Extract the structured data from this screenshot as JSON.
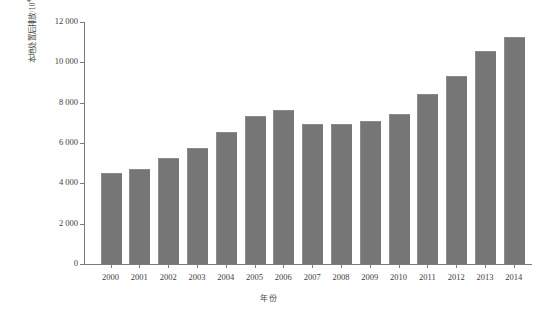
{
  "chart_data": {
    "type": "bar",
    "title": "",
    "subtitle": "",
    "xlabel": "年份",
    "ylabel": "本地处置后排放/10⁴ t",
    "ylabel_text": "本地处置后排放/10",
    "ylabel_unit_sup": "4",
    "ylabel_unit_tail": " t",
    "categories": [
      "2000",
      "2001",
      "2002",
      "2003",
      "2004",
      "2005",
      "2006",
      "2007",
      "2008",
      "2009",
      "2010",
      "2011",
      "2012",
      "2013",
      "2014"
    ],
    "values": [
      4480,
      4640,
      5200,
      5720,
      6500,
      7300,
      7580,
      6900,
      6900,
      7030,
      7400,
      8380,
      9250,
      10500,
      11200
    ],
    "ylim": [
      0,
      12000
    ],
    "yticks": [
      0,
      2000,
      4000,
      6000,
      8000,
      10000,
      12000
    ],
    "ytick_labels": [
      "0",
      "2 000",
      "4 000",
      "6 000",
      "8 000",
      "10 000",
      "12 000"
    ],
    "grid": false,
    "legend": false,
    "legend_position": "none",
    "bar_color": "#767676",
    "axis_color": "#7b7b7b",
    "text_color": "#3d3d3d"
  }
}
